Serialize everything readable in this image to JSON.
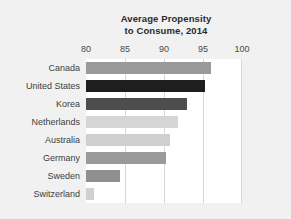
{
  "chart_data": {
    "type": "bar",
    "orientation": "horizontal",
    "title": "Average Propensity to Consume, 2014",
    "title_lines": [
      "Average Propensity",
      "to Consume, 2014"
    ],
    "xlabel": "",
    "ylabel": "",
    "xlim": [
      80,
      100
    ],
    "xticks": [
      80,
      85,
      90,
      95,
      100
    ],
    "xtick_labels": [
      "80",
      "85",
      "90",
      "95",
      "100"
    ],
    "grid": true,
    "grid_axis": "x",
    "legend": false,
    "categories": [
      "Canada",
      "United States",
      "Korea",
      "Netherlands",
      "Australia",
      "Germany",
      "Sweden",
      "Switzerland"
    ],
    "values": [
      96.0,
      95.2,
      93.0,
      91.8,
      90.8,
      90.2,
      84.3,
      81.0
    ],
    "bar_colors": [
      "#9a9a9a",
      "#1e1e1e",
      "#4d4d4d",
      "#d5d5d5",
      "#cfcfcf",
      "#9a9a9a",
      "#8f8f8f",
      "#d0d0d0"
    ]
  },
  "style": {
    "background": "#f1f1f1",
    "plot_background": "#ffffff",
    "gridline_color": "#d8d8d8",
    "text_color": "#3d3d3d",
    "title_color": "#2b2b2b"
  }
}
